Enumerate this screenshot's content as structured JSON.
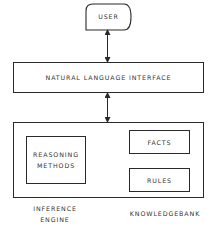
{
  "diagram": {
    "nodes": {
      "user": {
        "label": "USER"
      },
      "nli": {
        "label": "NATURAL LANGUAGE INTERFACE"
      },
      "reasoning": {
        "line1": "REASONING",
        "line2": "METHODS"
      },
      "facts": {
        "label": "FACTS"
      },
      "rules": {
        "label": "RULES"
      }
    },
    "captions": {
      "inference_line1": "INFERENCE",
      "inference_line2": "ENGINE",
      "knowledgebank": "KNOWLEDGEBANK"
    },
    "edges": [
      {
        "from": "user",
        "to": "nli",
        "direction": "bidirectional"
      },
      {
        "from": "nli",
        "to": "system",
        "direction": "bidirectional"
      }
    ],
    "colors": {
      "stroke": "#2a2a2a",
      "background": "#ffffff"
    }
  }
}
